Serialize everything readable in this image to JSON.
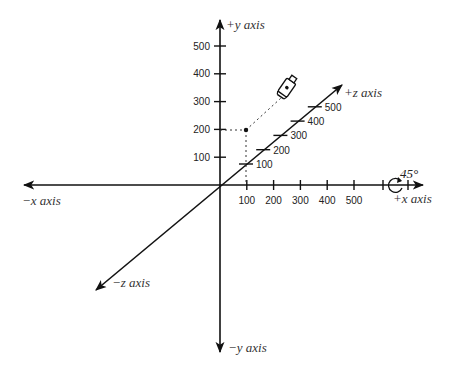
{
  "diagram": {
    "type": "3d-coordinate-axes",
    "axes": {
      "x_pos": "+x axis",
      "x_neg": "−x axis",
      "y_pos": "+y axis",
      "y_neg": "−y axis",
      "z_pos": "+z axis",
      "z_neg": "−z axis"
    },
    "x_ticks": [
      "100",
      "200",
      "300",
      "400",
      "500"
    ],
    "y_ticks": [
      "100",
      "200",
      "300",
      "400",
      "500"
    ],
    "z_ticks": [
      "100",
      "200",
      "300",
      "400",
      "500"
    ],
    "point": {
      "x": 100,
      "y": 200,
      "z": 0
    },
    "camera": {
      "icon": "video-camera-icon"
    },
    "rotation": {
      "axis": "x",
      "angle_label": "45°",
      "icon": "rotation-arrow-icon"
    }
  }
}
